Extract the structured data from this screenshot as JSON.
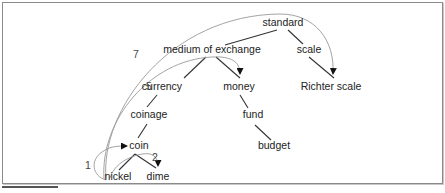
{
  "diagram": {
    "type": "tree-with-paths",
    "nodes": [
      {
        "id": "standard",
        "label": "standard",
        "x": 283,
        "y": 26
      },
      {
        "id": "medium_of_exchange",
        "label": "medium of exchange",
        "x": 212,
        "y": 53
      },
      {
        "id": "scale",
        "label": "scale",
        "x": 309,
        "y": 53
      },
      {
        "id": "currency",
        "label": "currency",
        "x": 162,
        "y": 90
      },
      {
        "id": "money",
        "label": "money",
        "x": 239,
        "y": 90
      },
      {
        "id": "richter_scale",
        "label": "Richter scale",
        "x": 331,
        "y": 90
      },
      {
        "id": "coinage",
        "label": "coinage",
        "x": 149,
        "y": 118
      },
      {
        "id": "fund",
        "label": "fund",
        "x": 253,
        "y": 118
      },
      {
        "id": "coin",
        "label": "coin",
        "x": 139,
        "y": 149
      },
      {
        "id": "budget",
        "label": "budget",
        "x": 274,
        "y": 149
      },
      {
        "id": "nickel",
        "label": "nickel",
        "x": 117,
        "y": 180
      },
      {
        "id": "dime",
        "label": "dime",
        "x": 158,
        "y": 180
      }
    ],
    "edges": [
      [
        "standard",
        "medium_of_exchange"
      ],
      [
        "standard",
        "scale"
      ],
      [
        "medium_of_exchange",
        "currency"
      ],
      [
        "medium_of_exchange",
        "money"
      ],
      [
        "scale",
        "richter_scale"
      ],
      [
        "currency",
        "coinage"
      ],
      [
        "money",
        "fund"
      ],
      [
        "coinage",
        "coin"
      ],
      [
        "fund",
        "budget"
      ],
      [
        "coin",
        "nickel"
      ],
      [
        "coin",
        "dime"
      ]
    ],
    "path_labels": [
      {
        "label": "7",
        "x": 136,
        "y": 58,
        "target": "richter_scale"
      },
      {
        "label": "5",
        "x": 149,
        "y": 90,
        "target": "money"
      },
      {
        "label": "2",
        "x": 155,
        "y": 161,
        "target": "dime"
      },
      {
        "label": "1",
        "x": 88,
        "y": 169,
        "target": "coin"
      }
    ],
    "colors": {
      "edge": "#333333",
      "arc": "#999999",
      "text": "#222222",
      "border": "#8a8a8a"
    }
  }
}
